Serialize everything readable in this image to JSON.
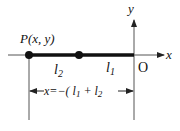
{
  "diagram": {
    "axes": {
      "x_label": "x",
      "y_label": "y",
      "origin_label": "O"
    },
    "point": {
      "label": "P(x, y)"
    },
    "segments": [
      {
        "label_base": "l",
        "label_sub": "2"
      },
      {
        "label_base": "l",
        "label_sub": "1"
      }
    ],
    "dimension": {
      "prefix": "x=−( ",
      "term1_base": "l",
      "term1_sub": "1",
      "plus": " + ",
      "term2_base": "l",
      "term2_sub": "2",
      "suffix": " )"
    },
    "colors": {
      "line": "#111111",
      "axis": "#555555",
      "background": "#ffffff"
    }
  }
}
